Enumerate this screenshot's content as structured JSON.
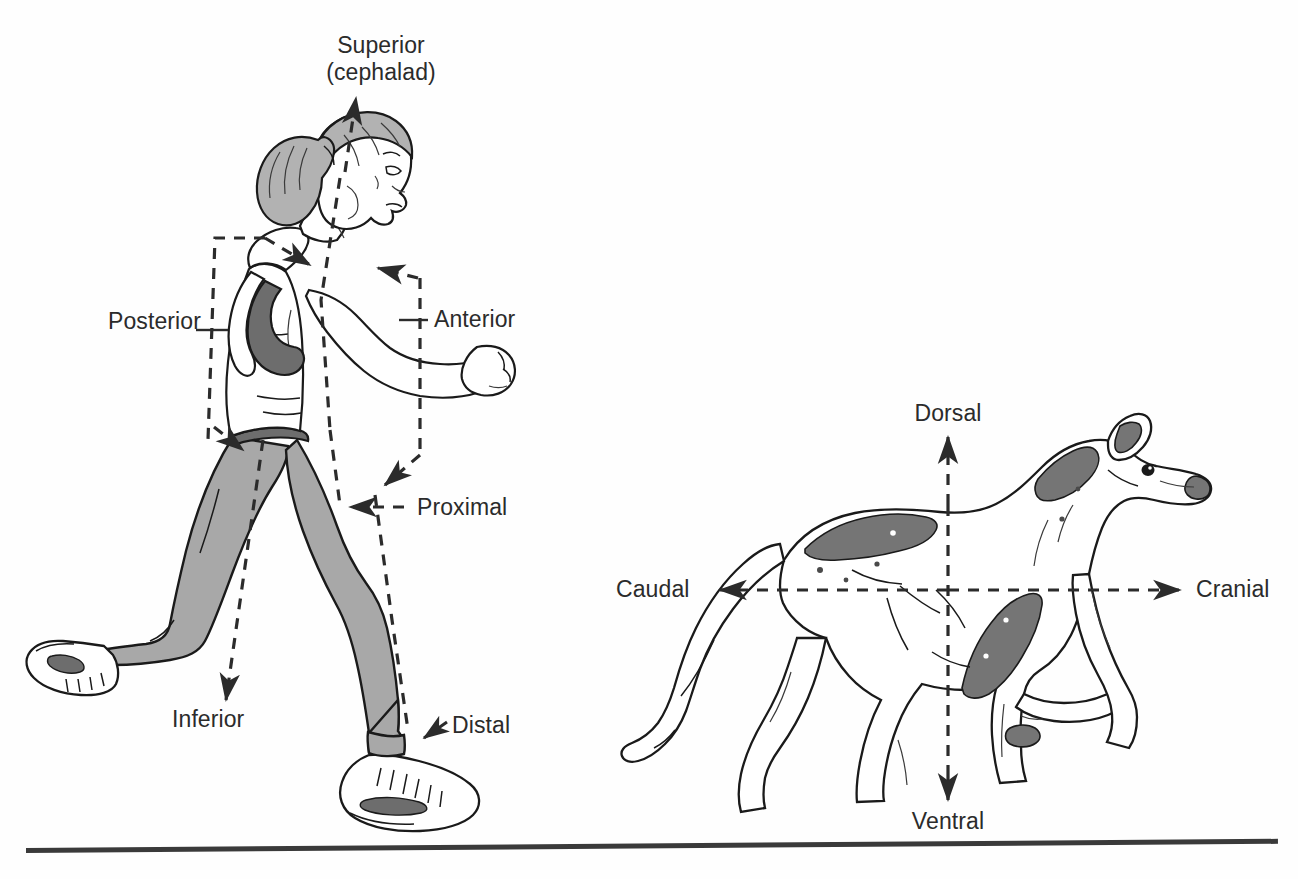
{
  "figure": {
    "background_color": "#fefefe",
    "ink_color": "#1a1a1a",
    "text_color": "#2b2b2b",
    "accent_gray": "#a8a8a8",
    "patch_gray": "#757575"
  },
  "human_panel": {
    "subject": "running-woman-lateral-view",
    "labels": {
      "superior_line1": "Superior",
      "superior_line2": "(cephalad)",
      "inferior": "Inferior",
      "anterior": "Anterior",
      "posterior": "Posterior",
      "proximal": "Proximal",
      "distal": "Distal"
    }
  },
  "dog_panel": {
    "subject": "greyhound-dog-lateral-view",
    "labels": {
      "dorsal": "Dorsal",
      "ventral": "Ventral",
      "cranial": "Cranial",
      "caudal": "Caudal"
    }
  }
}
